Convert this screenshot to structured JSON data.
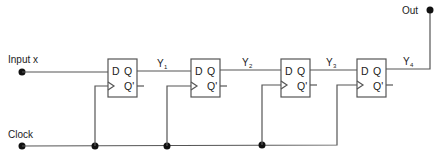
{
  "diagram": {
    "type": "shift-register",
    "inputs": {
      "data_label": "Input x",
      "clock_label": "Clock"
    },
    "output": {
      "label": "Out"
    },
    "flip_flops": [
      {
        "d": "D",
        "q": "Q",
        "qn": "Q'",
        "out_label": "Y",
        "out_sub": "1"
      },
      {
        "d": "D",
        "q": "Q",
        "qn": "Q'",
        "out_label": "Y",
        "out_sub": "2"
      },
      {
        "d": "D",
        "q": "Q",
        "qn": "Q'",
        "out_label": "Y",
        "out_sub": "3"
      },
      {
        "d": "D",
        "q": "Q",
        "qn": "Q'",
        "out_label": "Y",
        "out_sub": "4"
      }
    ],
    "colors": {
      "wire": "#555555",
      "node": "#111111",
      "text": "#222222"
    }
  }
}
